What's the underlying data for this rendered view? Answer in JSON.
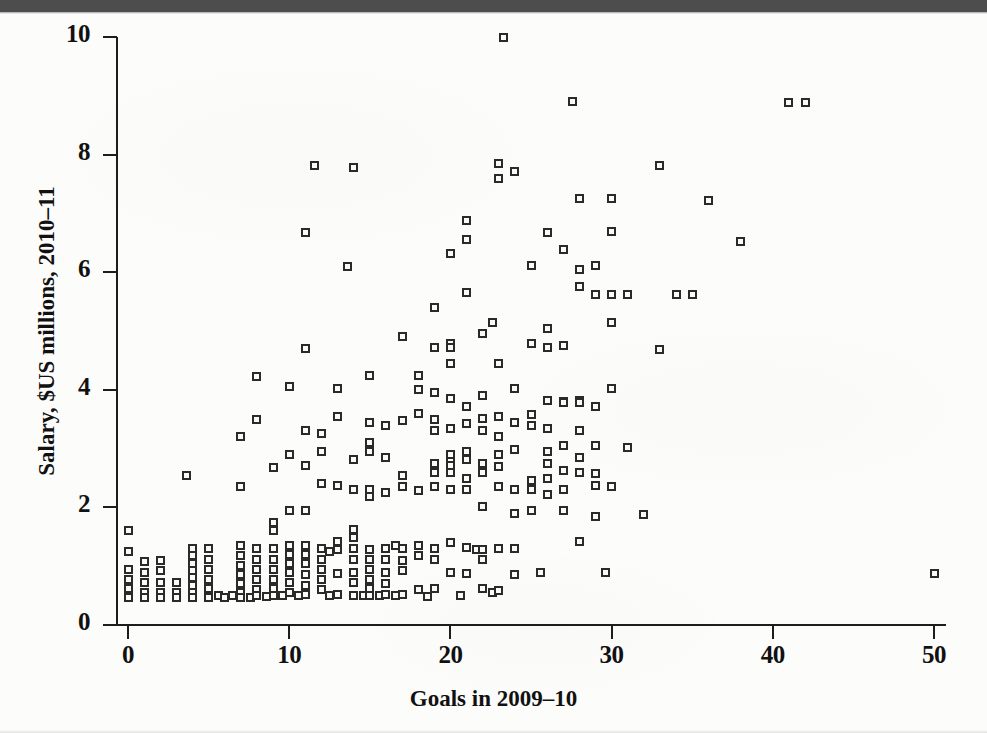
{
  "page": {
    "scan_band_color": "#4d4d4d",
    "paper_color": "#fcfcfa",
    "ink_color": "#1d1d1d"
  },
  "chart_data": {
    "type": "scatter",
    "title": "",
    "xlabel": "Goals in 2009–10",
    "ylabel": "Salary, $US millions, 2010–11",
    "xlim": [
      -1.5,
      53
    ],
    "ylim": [
      0,
      10
    ],
    "xticks": [
      0,
      10,
      20,
      30,
      40,
      50
    ],
    "xticklabels": [
      "0",
      "10",
      "20",
      "30",
      "40",
      "50"
    ],
    "yticks": [
      0,
      2,
      4,
      6,
      8,
      10
    ],
    "yticklabels": [
      "0",
      "2",
      "4",
      "6",
      "8",
      "10"
    ],
    "grid": false,
    "legend": null,
    "marker": "open-square",
    "marker_color": "#2a2a2a",
    "n_points": 281,
    "points": [
      [
        0,
        1.6
      ],
      [
        0,
        1.25
      ],
      [
        0,
        0.95
      ],
      [
        0,
        0.78
      ],
      [
        0,
        0.62
      ],
      [
        0,
        0.48
      ],
      [
        0,
        0.46
      ],
      [
        1,
        1.08
      ],
      [
        1,
        0.9
      ],
      [
        1,
        0.72
      ],
      [
        1,
        0.55
      ],
      [
        1,
        0.46
      ],
      [
        2,
        1.1
      ],
      [
        2,
        0.93
      ],
      [
        2,
        0.72
      ],
      [
        2,
        0.55
      ],
      [
        2,
        0.46
      ],
      [
        3,
        0.72
      ],
      [
        3,
        0.55
      ],
      [
        3,
        0.46
      ],
      [
        3.6,
        2.55
      ],
      [
        4,
        1.3
      ],
      [
        4,
        1.18
      ],
      [
        4,
        1.05
      ],
      [
        4,
        0.93
      ],
      [
        4,
        0.8
      ],
      [
        4,
        0.68
      ],
      [
        4,
        0.55
      ],
      [
        4,
        0.46
      ],
      [
        5,
        1.3
      ],
      [
        5,
        1.12
      ],
      [
        5,
        0.95
      ],
      [
        5,
        0.78
      ],
      [
        5,
        0.62
      ],
      [
        5,
        0.5
      ],
      [
        5,
        0.46
      ],
      [
        5.6,
        0.5
      ],
      [
        6,
        0.46
      ],
      [
        6.5,
        0.5
      ],
      [
        7,
        3.2
      ],
      [
        7,
        2.35
      ],
      [
        7,
        1.35
      ],
      [
        7,
        1.18
      ],
      [
        7,
        1.02
      ],
      [
        7,
        0.86
      ],
      [
        7,
        0.7
      ],
      [
        7,
        0.55
      ],
      [
        7,
        0.46
      ],
      [
        7.6,
        0.46
      ],
      [
        8,
        4.22
      ],
      [
        8,
        3.5
      ],
      [
        8,
        1.3
      ],
      [
        8,
        1.12
      ],
      [
        8,
        0.95
      ],
      [
        8,
        0.78
      ],
      [
        8,
        0.6
      ],
      [
        8,
        0.5
      ],
      [
        8.6,
        0.48
      ],
      [
        9,
        2.68
      ],
      [
        9,
        1.75
      ],
      [
        9,
        1.6
      ],
      [
        9,
        1.3
      ],
      [
        9,
        1.12
      ],
      [
        9,
        0.95
      ],
      [
        9,
        0.78
      ],
      [
        9,
        0.62
      ],
      [
        9,
        0.5
      ],
      [
        9.6,
        0.5
      ],
      [
        10,
        4.05
      ],
      [
        10,
        2.9
      ],
      [
        10,
        1.95
      ],
      [
        10,
        1.35
      ],
      [
        10,
        1.2
      ],
      [
        10,
        1.05
      ],
      [
        10,
        0.9
      ],
      [
        10,
        0.72
      ],
      [
        10,
        0.55
      ],
      [
        10.6,
        0.5
      ],
      [
        11,
        6.68
      ],
      [
        11,
        4.7
      ],
      [
        11,
        3.3
      ],
      [
        11,
        2.72
      ],
      [
        11,
        1.95
      ],
      [
        11,
        1.35
      ],
      [
        11,
        1.2
      ],
      [
        11,
        1.05
      ],
      [
        11,
        0.86
      ],
      [
        11,
        0.68
      ],
      [
        11,
        0.52
      ],
      [
        11.6,
        7.82
      ],
      [
        12,
        3.25
      ],
      [
        12,
        2.95
      ],
      [
        12,
        2.4
      ],
      [
        12,
        1.3
      ],
      [
        12,
        1.12
      ],
      [
        12,
        0.95
      ],
      [
        12,
        0.78
      ],
      [
        12,
        0.6
      ],
      [
        12.5,
        1.25
      ],
      [
        12.5,
        0.5
      ],
      [
        13,
        4.02
      ],
      [
        13,
        3.55
      ],
      [
        13,
        2.38
      ],
      [
        13,
        1.42
      ],
      [
        13,
        1.28
      ],
      [
        13,
        0.88
      ],
      [
        13,
        0.52
      ],
      [
        13.6,
        6.1
      ],
      [
        14,
        7.78
      ],
      [
        14,
        2.82
      ],
      [
        14,
        2.3
      ],
      [
        14,
        1.62
      ],
      [
        14,
        1.48
      ],
      [
        14,
        1.3
      ],
      [
        14,
        1.12
      ],
      [
        14,
        0.9
      ],
      [
        14,
        0.72
      ],
      [
        14,
        0.5
      ],
      [
        14.6,
        0.5
      ],
      [
        15,
        4.25
      ],
      [
        15,
        3.45
      ],
      [
        15,
        3.1
      ],
      [
        15,
        2.95
      ],
      [
        15,
        2.3
      ],
      [
        15,
        2.18
      ],
      [
        15,
        1.28
      ],
      [
        15,
        1.12
      ],
      [
        15,
        0.95
      ],
      [
        15,
        0.78
      ],
      [
        15,
        0.62
      ],
      [
        15,
        0.5
      ],
      [
        15.6,
        0.5
      ],
      [
        16,
        3.4
      ],
      [
        16,
        2.85
      ],
      [
        16,
        2.25
      ],
      [
        16,
        1.3
      ],
      [
        16,
        1.12
      ],
      [
        16,
        0.9
      ],
      [
        16,
        0.7
      ],
      [
        16,
        0.52
      ],
      [
        16.6,
        1.35
      ],
      [
        16.6,
        0.5
      ],
      [
        17,
        4.9
      ],
      [
        17,
        3.48
      ],
      [
        17,
        2.55
      ],
      [
        17,
        2.35
      ],
      [
        17,
        1.3
      ],
      [
        17,
        1.1
      ],
      [
        17,
        0.92
      ],
      [
        17,
        0.52
      ],
      [
        18,
        4.25
      ],
      [
        18,
        4.0
      ],
      [
        18,
        3.6
      ],
      [
        18,
        2.28
      ],
      [
        18,
        1.35
      ],
      [
        18,
        1.18
      ],
      [
        18,
        0.6
      ],
      [
        18.6,
        0.48
      ],
      [
        19,
        5.4
      ],
      [
        19,
        4.72
      ],
      [
        19,
        3.95
      ],
      [
        19,
        3.5
      ],
      [
        19,
        3.3
      ],
      [
        19,
        2.75
      ],
      [
        19,
        2.6
      ],
      [
        19,
        2.35
      ],
      [
        19,
        1.3
      ],
      [
        19,
        1.12
      ],
      [
        19,
        0.62
      ],
      [
        20,
        6.32
      ],
      [
        20,
        4.78
      ],
      [
        20,
        4.72
      ],
      [
        20,
        4.45
      ],
      [
        20,
        3.85
      ],
      [
        20,
        3.35
      ],
      [
        20,
        2.9
      ],
      [
        20,
        2.78
      ],
      [
        20,
        2.72
      ],
      [
        20,
        2.6
      ],
      [
        20,
        2.3
      ],
      [
        20,
        1.4
      ],
      [
        20,
        0.9
      ],
      [
        20.6,
        0.5
      ],
      [
        21,
        6.88
      ],
      [
        21,
        6.55
      ],
      [
        21,
        5.65
      ],
      [
        21,
        3.72
      ],
      [
        21,
        3.42
      ],
      [
        21,
        2.95
      ],
      [
        21,
        2.82
      ],
      [
        21,
        2.5
      ],
      [
        21,
        2.3
      ],
      [
        21,
        1.32
      ],
      [
        21,
        0.88
      ],
      [
        21.6,
        1.28
      ],
      [
        22,
        4.95
      ],
      [
        22,
        3.9
      ],
      [
        22,
        3.52
      ],
      [
        22,
        3.3
      ],
      [
        22,
        2.75
      ],
      [
        22,
        2.6
      ],
      [
        22,
        2.02
      ],
      [
        22,
        1.28
      ],
      [
        22,
        1.12
      ],
      [
        22,
        0.62
      ],
      [
        22.6,
        5.15
      ],
      [
        22.6,
        0.55
      ],
      [
        23,
        7.85
      ],
      [
        23,
        7.6
      ],
      [
        23,
        4.45
      ],
      [
        23,
        3.55
      ],
      [
        23,
        3.2
      ],
      [
        23,
        2.9
      ],
      [
        23,
        2.7
      ],
      [
        23,
        2.35
      ],
      [
        23,
        1.3
      ],
      [
        23,
        0.58
      ],
      [
        23.3,
        10.0
      ],
      [
        24,
        7.72
      ],
      [
        24,
        4.02
      ],
      [
        24,
        3.45
      ],
      [
        24,
        2.98
      ],
      [
        24,
        2.3
      ],
      [
        24,
        1.9
      ],
      [
        24,
        1.3
      ],
      [
        24,
        0.86
      ],
      [
        25,
        6.12
      ],
      [
        25,
        4.78
      ],
      [
        25,
        3.58
      ],
      [
        25,
        3.4
      ],
      [
        25,
        2.45
      ],
      [
        25,
        2.3
      ],
      [
        25,
        1.95
      ],
      [
        25.6,
        0.9
      ],
      [
        26,
        6.68
      ],
      [
        26,
        5.05
      ],
      [
        26,
        4.72
      ],
      [
        26,
        3.82
      ],
      [
        26,
        3.35
      ],
      [
        26,
        2.95
      ],
      [
        26,
        2.75
      ],
      [
        26,
        2.5
      ],
      [
        26,
        2.22
      ],
      [
        27,
        6.38
      ],
      [
        27,
        4.75
      ],
      [
        27,
        3.8
      ],
      [
        27,
        3.78
      ],
      [
        27,
        3.05
      ],
      [
        27,
        2.62
      ],
      [
        27,
        2.3
      ],
      [
        27,
        1.95
      ],
      [
        27.6,
        8.9
      ],
      [
        28,
        7.25
      ],
      [
        28,
        6.05
      ],
      [
        28,
        5.75
      ],
      [
        28,
        3.82
      ],
      [
        28,
        3.78
      ],
      [
        28,
        3.3
      ],
      [
        28,
        2.85
      ],
      [
        28,
        2.6
      ],
      [
        28,
        1.42
      ],
      [
        29,
        6.12
      ],
      [
        29,
        5.62
      ],
      [
        29,
        3.72
      ],
      [
        29,
        3.05
      ],
      [
        29,
        2.58
      ],
      [
        29,
        2.38
      ],
      [
        29,
        1.85
      ],
      [
        29.6,
        0.9
      ],
      [
        30,
        7.25
      ],
      [
        30,
        6.7
      ],
      [
        30,
        5.62
      ],
      [
        30,
        5.15
      ],
      [
        30,
        4.02
      ],
      [
        30,
        2.35
      ],
      [
        31,
        5.62
      ],
      [
        31,
        3.02
      ],
      [
        32,
        1.88
      ],
      [
        33,
        7.82
      ],
      [
        33,
        4.68
      ],
      [
        34,
        5.62
      ],
      [
        35,
        5.62
      ],
      [
        36,
        7.22
      ],
      [
        38,
        6.52
      ],
      [
        41,
        8.88
      ],
      [
        42,
        8.88
      ],
      [
        50,
        0.88
      ]
    ]
  }
}
